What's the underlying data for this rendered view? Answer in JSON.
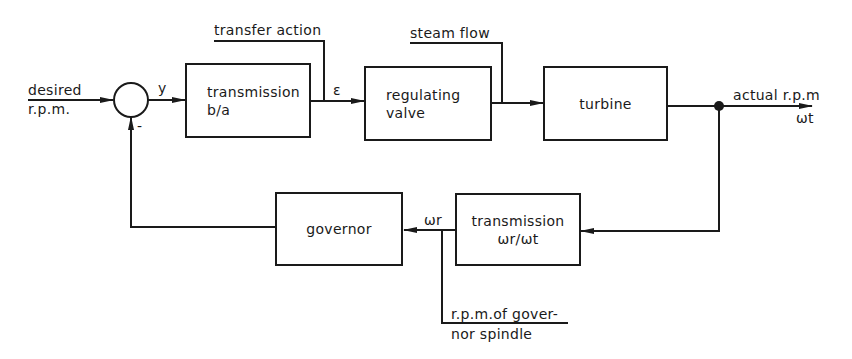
{
  "diagram": {
    "type": "block-diagram",
    "colors": {
      "line": "#1a1a1a",
      "background": "#ffffff"
    },
    "input": {
      "line1": "desired",
      "line2": "r.p.m."
    },
    "summing_junction": {
      "sign": "-"
    },
    "signals": {
      "y": "y",
      "epsilon": "ε",
      "omega_r": "ωr",
      "output_line1": "actual r.p.m",
      "output_line2": "ωt"
    },
    "disturbances": {
      "transfer_action": "transfer action",
      "steam_flow": "steam flow"
    },
    "blocks": {
      "transmission_ba": {
        "line1": "transmission",
        "line2": "b/a"
      },
      "regulating_valve": {
        "line1": "regulating",
        "line2": "valve"
      },
      "turbine": {
        "line1": "turbine"
      },
      "transmission_feedback": {
        "line1": "transmission",
        "line2": "ωr/ωt"
      },
      "governor": {
        "line1": "governor"
      }
    },
    "annotation": {
      "line1": "r.p.m.of gover-",
      "line2": "nor spindle"
    }
  }
}
